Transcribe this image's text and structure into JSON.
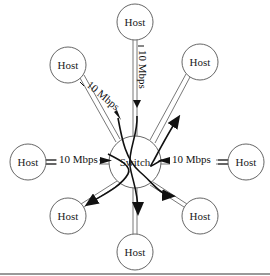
{
  "diagram": {
    "type": "star-network",
    "switch": {
      "label": "Switch",
      "x": 135,
      "y": 162,
      "r": 26
    },
    "hosts": [
      {
        "id": "host-top",
        "label": "Host",
        "x": 135,
        "y": 22
      },
      {
        "id": "host-top-right",
        "label": "Host",
        "x": 200,
        "y": 62
      },
      {
        "id": "host-right",
        "label": "Host",
        "x": 246,
        "y": 162
      },
      {
        "id": "host-bottom-right",
        "label": "Host",
        "x": 200,
        "y": 216
      },
      {
        "id": "host-bottom",
        "label": "Host",
        "x": 135,
        "y": 252
      },
      {
        "id": "host-bottom-left",
        "label": "Host",
        "x": 68,
        "y": 216
      },
      {
        "id": "host-left",
        "label": "Host",
        "x": 28,
        "y": 162
      },
      {
        "id": "host-top-left",
        "label": "Host",
        "x": 68,
        "y": 65
      }
    ],
    "link_labels": {
      "top": "10 Mbps",
      "top_left": "10 Mbps",
      "left": "10 Mbps",
      "right": "10 Mbps"
    }
  }
}
